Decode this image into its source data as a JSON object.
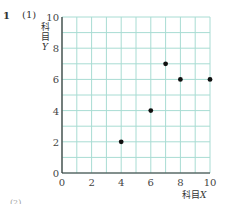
{
  "header": {
    "problem_number": "1",
    "sub_number": "(1)"
  },
  "axes": {
    "ylabel_chars": [
      "科",
      "目"
    ],
    "ylabel_var": "Y",
    "xlabel_text": "科目",
    "xlabel_var": "X"
  },
  "colors": {
    "grid": "#a8dcd3",
    "axis": "#333333",
    "point": "#111111"
  },
  "footer": {
    "next_label": "(2)"
  },
  "chart_data": {
    "type": "scatter",
    "title": "",
    "xlabel": "科目X",
    "ylabel": "科目Y",
    "xlim": [
      0,
      10
    ],
    "ylim": [
      0,
      10
    ],
    "x_ticks": [
      0,
      2,
      4,
      6,
      8,
      10
    ],
    "y_ticks": [
      0,
      2,
      4,
      6,
      8,
      10
    ],
    "grid": true,
    "grid_step": 1,
    "points": [
      {
        "x": 4,
        "y": 2
      },
      {
        "x": 6,
        "y": 4
      },
      {
        "x": 7,
        "y": 7
      },
      {
        "x": 8,
        "y": 6
      },
      {
        "x": 10,
        "y": 6
      }
    ],
    "x": [
      4,
      6,
      7,
      8,
      10
    ],
    "y": [
      2,
      4,
      7,
      6,
      6
    ]
  }
}
